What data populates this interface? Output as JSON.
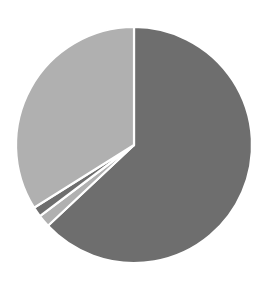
{
  "chart_data": {
    "type": "pie",
    "title": "",
    "subtitle": "",
    "xlabel": "",
    "ylabel": "",
    "legend": false,
    "legend_position": "none",
    "grid": false,
    "labels_shown": false,
    "start_angle_deg": 0,
    "direction": "clockwise",
    "center_x": 134,
    "center_y": 145,
    "radius": 118,
    "separator_color": "#ffffff",
    "separator_width": 2.2,
    "background": "#ffffff",
    "categories": [
      "Slice 1",
      "Slice 2",
      "Slice 3",
      "Slice 4"
    ],
    "values": [
      63.0,
      1.7,
      1.4,
      33.9
    ],
    "percentages": [
      "63.0%",
      "1.7%",
      "1.4%",
      "33.9%"
    ],
    "angles_deg": [
      226.8,
      6.1,
      5.0,
      122.1
    ],
    "colors": [
      "#6e6e6e",
      "#b0b0b0",
      "#6e6e6e",
      "#b0b0b0"
    ],
    "slices": [
      {
        "name": "Slice 1",
        "value": 63.0,
        "percent": "63.0%",
        "color": "#6e6e6e",
        "start_deg": 0.0,
        "end_deg": 226.8
      },
      {
        "name": "Slice 2",
        "value": 1.7,
        "percent": "1.7%",
        "color": "#b0b0b0",
        "start_deg": 226.8,
        "end_deg": 232.9
      },
      {
        "name": "Slice 3",
        "value": 1.4,
        "percent": "1.4%",
        "color": "#6e6e6e",
        "start_deg": 232.9,
        "end_deg": 237.9
      },
      {
        "name": "Slice 4",
        "value": 33.9,
        "percent": "33.9%",
        "color": "#b0b0b0",
        "start_deg": 237.9,
        "end_deg": 360.0
      }
    ]
  }
}
